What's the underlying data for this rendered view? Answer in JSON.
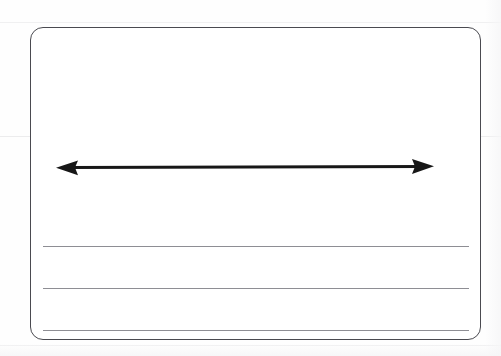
{
  "document": {
    "type": "scanned-worksheet-page",
    "background_color": "#fefefe",
    "page_width": 501,
    "page_height": 356,
    "title_text": "",
    "body_text": "",
    "notes": ""
  },
  "answer_box": {
    "name": "answer-box",
    "border_color": "#4a4a50",
    "fill_color": "#ffffff",
    "corner_radius": 13,
    "left": 30,
    "top": 27,
    "width": 451,
    "height": 313,
    "label": ""
  },
  "arrow": {
    "name": "double-headed-arrow",
    "direction": "bidirectional-horizontal",
    "color": "#171717",
    "label": "",
    "left_tip_x": 56,
    "right_tip_x": 434,
    "center_y": 167,
    "shaft_thickness": 3,
    "head_length": 20,
    "head_width": 15
  },
  "rules": {
    "name": "writing-lines",
    "color": "#8e8e94",
    "count": 3,
    "left": 43,
    "width": 426,
    "y_positions": [
      246,
      288,
      330
    ],
    "labels": [
      "",
      "",
      ""
    ]
  },
  "scan_artifacts": {
    "name": "scan-fold-lines",
    "color": "#f0f0f1",
    "y_positions": [
      22,
      136,
      345
    ]
  }
}
